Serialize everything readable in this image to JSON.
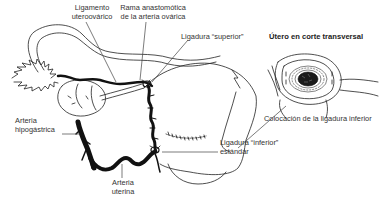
{
  "diagram": {
    "main_view": {
      "labels": [
        {
          "id": "lig-uteroovarico",
          "lines": [
            "Ligamento",
            "uteroovárico"
          ]
        },
        {
          "id": "rama-anastomotica",
          "lines": [
            "Rama anastomótica",
            "de la arteria ovárica"
          ]
        },
        {
          "id": "ligadura-superior",
          "lines": [
            "Ligadura “superior”"
          ]
        },
        {
          "id": "arteria-hipogastrica",
          "lines": [
            "Arteria",
            "hipogástrica"
          ]
        },
        {
          "id": "arteria-uterina",
          "lines": [
            "Arteria",
            "uterina"
          ]
        },
        {
          "id": "ligadura-inferior",
          "lines": [
            "Ligadura “inferior”",
            "estándar"
          ]
        }
      ]
    },
    "inset": {
      "title": "Útero en corte transversal",
      "caption": "Colocación de la ligadura inferior"
    },
    "colors": {
      "background": "#ffffff",
      "line": "#222222",
      "vessel": "#111111",
      "text": "#333333"
    }
  }
}
